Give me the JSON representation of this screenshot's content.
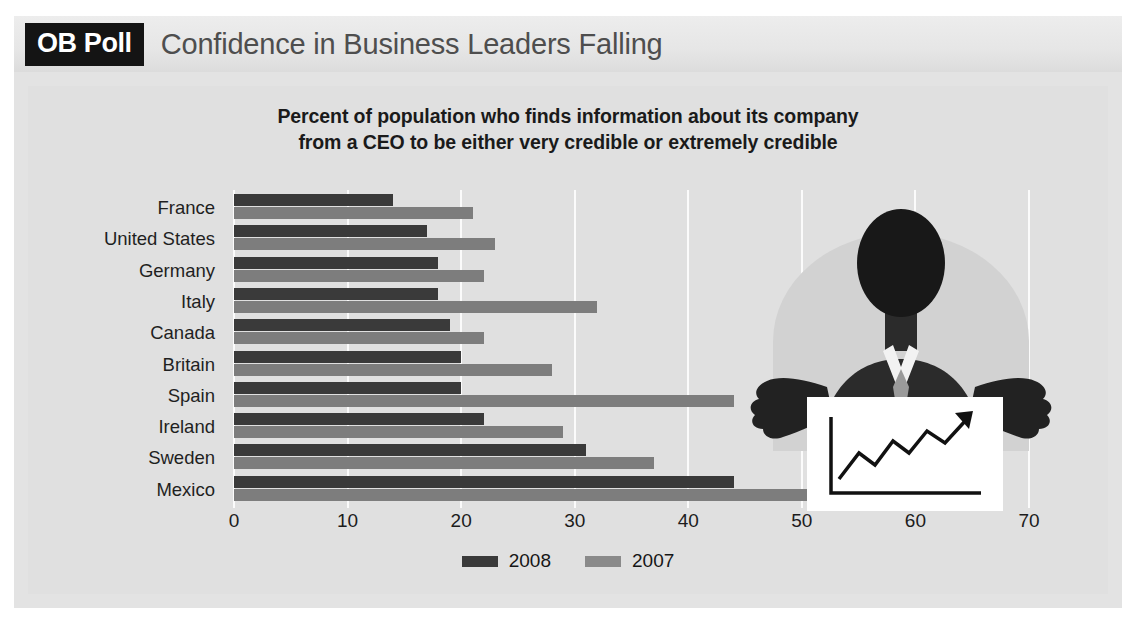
{
  "header": {
    "badge": "OB Poll",
    "title": "Confidence in Business Leaders Falling"
  },
  "chart_data": {
    "type": "bar",
    "orientation": "horizontal",
    "title": "",
    "subtitle_line1": "Percent of population who finds information about its company",
    "subtitle_line2": "from a CEO to be either very credible or extremely credible",
    "categories": [
      "France",
      "United States",
      "Germany",
      "Italy",
      "Canada",
      "Britain",
      "Spain",
      "Ireland",
      "Sweden",
      "Mexico"
    ],
    "series": [
      {
        "name": "2008",
        "color": "#3a3a3a",
        "values": [
          14,
          17,
          18,
          18,
          19,
          20,
          20,
          22,
          31,
          44
        ]
      },
      {
        "name": "2007",
        "color": "#7d7d7d",
        "values": [
          21,
          23,
          22,
          32,
          22,
          28,
          44,
          29,
          37,
          61
        ]
      }
    ],
    "xlabel": "",
    "ylabel": "",
    "xlim": [
      0,
      70
    ],
    "xticks": [
      0,
      10,
      20,
      30,
      40,
      50,
      60,
      70
    ],
    "grid": true,
    "legend_position": "bottom"
  },
  "illustration": {
    "name": "ceo-presenting-rising-chart",
    "alt": "Silhouette of a businessman pointing at a whiteboard showing a rising line chart"
  },
  "colors": {
    "card_background": "#e3e3e3",
    "panel_background": "#e0e0e0",
    "header_background": "#e9e9e9",
    "badge_background": "#141414",
    "badge_text": "#ffffff",
    "header_title_text": "#4e4e4e",
    "gridline": "#fbfbfb",
    "series_2008": "#3a3a3a",
    "series_2007": "#7d7d7d",
    "axis_text": "#1c1c1c"
  }
}
